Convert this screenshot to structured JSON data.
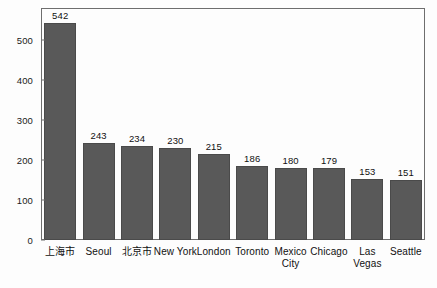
{
  "chart_data": {
    "type": "bar",
    "title": "",
    "subtitle": "",
    "xlabel": "",
    "ylabel": "",
    "categories": [
      "上海市",
      "Seoul",
      "北京市",
      "New York",
      "London",
      "Toronto",
      "Mexico City",
      "Chicago",
      "Las Vegas",
      "Seattle"
    ],
    "values": [
      542,
      243,
      234,
      230,
      215,
      186,
      180,
      179,
      153,
      151
    ],
    "data_labels": [
      "542",
      "243",
      "234",
      "230",
      "215",
      "186",
      "180",
      "179",
      "153",
      "151"
    ],
    "ylim": [
      0,
      580
    ],
    "yticks": [
      0,
      100,
      200,
      300,
      400,
      500
    ],
    "ytick_labels": [
      "0",
      "100",
      "200",
      "300",
      "400",
      "500"
    ],
    "grid": false,
    "legend": false,
    "bar_color": "#595959",
    "frame_color": "#6e6e6e",
    "background_color": "#fdfdfd",
    "text_color": "#111111"
  }
}
